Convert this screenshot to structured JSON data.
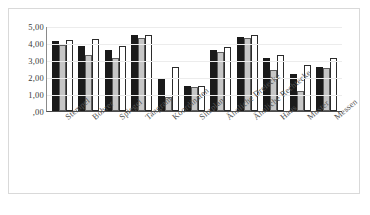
{
  "chart_data": {
    "type": "bar",
    "title": "",
    "xlabel": "",
    "ylabel": "",
    "ylim": [
      0,
      5
    ],
    "grid": true,
    "legend": "none",
    "ytick_labels": [
      "5,00",
      "4,00",
      "3,00",
      "2,00",
      "1,00",
      ",00"
    ],
    "ytick_values": [
      5,
      4,
      3,
      2,
      1,
      0
    ],
    "categories": [
      "Stempel",
      "Bohrer",
      "Spiegel",
      "Tangram",
      "Koordinaten",
      "Sitzplan",
      "Ähnliche Dreiecke",
      "Ähnliche Rechtecke",
      "Haus",
      "Muster",
      "Messen"
    ],
    "series": [
      {
        "name": "series-1",
        "color": "#1a1a1a",
        "values": [
          4.1,
          3.85,
          3.6,
          4.45,
          1.9,
          1.45,
          3.6,
          4.35,
          3.1,
          2.15,
          2.6
        ]
      },
      {
        "name": "series-2",
        "color": "#c6c6c6",
        "values": [
          3.9,
          3.3,
          3.1,
          4.3,
          0.85,
          1.4,
          3.5,
          4.3,
          2.4,
          1.2,
          2.55
        ]
      },
      {
        "name": "series-3",
        "color": "#ffffff",
        "values": [
          4.2,
          4.25,
          3.85,
          4.5,
          2.6,
          1.45,
          3.75,
          4.45,
          3.3,
          2.7,
          3.1
        ]
      }
    ]
  }
}
